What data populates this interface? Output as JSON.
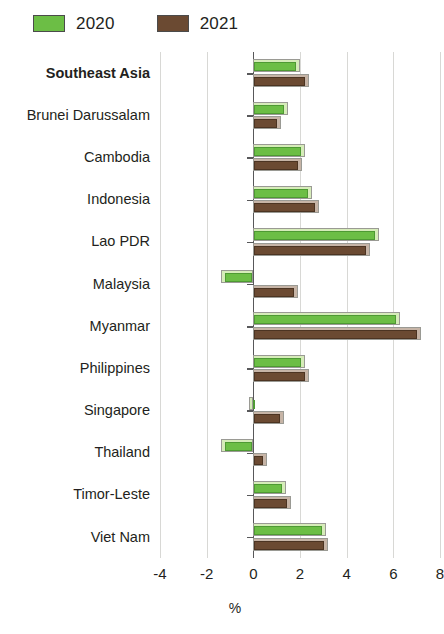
{
  "legend": {
    "items": [
      {
        "label": "2020",
        "color": "#6cbe45",
        "name": "legend-2020"
      },
      {
        "label": "2021",
        "color": "#6b4a32",
        "name": "legend-2021"
      }
    ]
  },
  "axis": {
    "x_title": "%",
    "tick_labels": [
      "-4",
      "-2",
      "0",
      "2",
      "4",
      "6",
      "8"
    ]
  },
  "chart_data": {
    "type": "bar",
    "orientation": "horizontal",
    "title": "",
    "subtitle": "",
    "xlabel": "%",
    "ylabel": "",
    "xlim": [
      -4,
      8
    ],
    "xticks": [
      -4,
      -2,
      0,
      2,
      4,
      6,
      8
    ],
    "grid": true,
    "legend_position": "top-left",
    "categories": [
      "Southeast Asia",
      "Brunei Darussalam",
      "Cambodia",
      "Indonesia",
      "Lao PDR",
      "Malaysia",
      "Myanmar",
      "Philippines",
      "Singapore",
      "Thailand",
      "Timor-Leste",
      "Viet Nam"
    ],
    "highlighted_category": "Southeast Asia",
    "series": [
      {
        "name": "2020",
        "color": "#6cbe45",
        "values": [
          2.0,
          1.5,
          2.2,
          2.5,
          5.4,
          -1.4,
          6.3,
          2.2,
          -0.2,
          -1.4,
          1.4,
          3.1
        ]
      },
      {
        "name": "2021",
        "color": "#6b4a32",
        "values": [
          2.4,
          1.2,
          2.1,
          2.8,
          5.0,
          1.9,
          7.2,
          2.4,
          1.3,
          0.6,
          1.6,
          3.2
        ]
      }
    ]
  }
}
